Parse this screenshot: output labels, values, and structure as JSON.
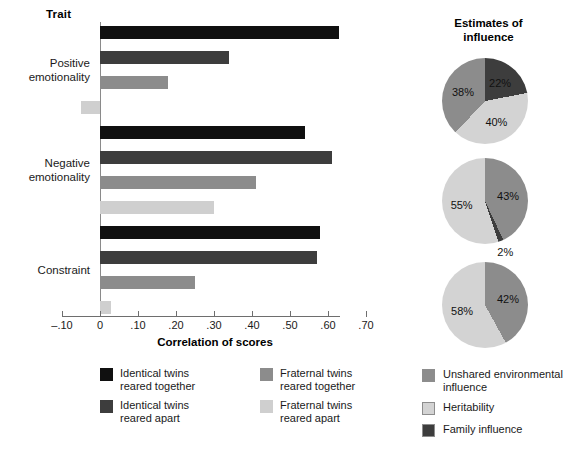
{
  "chart_data": [
    {
      "type": "bar",
      "orientation": "horizontal",
      "title": "",
      "xlabel": "Correlation of scores",
      "ylabel": "Trait",
      "xlim": [
        -0.1,
        0.7
      ],
      "xticks": [
        -0.1,
        0.0,
        0.1,
        0.2,
        0.3,
        0.4,
        0.5,
        0.6,
        0.7
      ],
      "xtick_labels": [
        "–.10",
        "0",
        ".10",
        ".20",
        ".30",
        ".40",
        ".50",
        ".60",
        ".70"
      ],
      "grid": false,
      "categories": [
        "Positive emotionality",
        "Negative emotionality",
        "Constraint"
      ],
      "series": [
        {
          "name": "Identical twins reared together",
          "color": "#101010",
          "values": [
            0.63,
            0.54,
            0.58
          ]
        },
        {
          "name": "Identical twins reared apart",
          "color": "#3d3d3d",
          "values": [
            0.34,
            0.61,
            0.57
          ]
        },
        {
          "name": "Fraternal twins reared together",
          "color": "#8c8c8c",
          "values": [
            0.18,
            0.41,
            0.25
          ]
        },
        {
          "name": "Fraternal twins reared apart",
          "color": "#cfcfcf",
          "values": [
            -0.05,
            0.3,
            0.03
          ]
        }
      ],
      "legend_position": "bottom-left"
    },
    {
      "type": "pie",
      "title": "Estimates of influence",
      "index": 1,
      "labels": [
        "Family influence",
        "Heritability",
        "Unshared environmental influence"
      ],
      "values": [
        22,
        40,
        38
      ],
      "display_labels": [
        "22%",
        "40%",
        "38%"
      ],
      "colors": [
        "#3d3d3d",
        "#d3d3d3",
        "#8c8c8c"
      ]
    },
    {
      "type": "pie",
      "title": "",
      "index": 2,
      "labels": [
        "Unshared environmental influence",
        "Family influence",
        "Heritability"
      ],
      "values": [
        43,
        2,
        55
      ],
      "display_labels": [
        "43%",
        "2%",
        "55%"
      ],
      "colors": [
        "#8c8c8c",
        "#3d3d3d",
        "#d3d3d3"
      ]
    },
    {
      "type": "pie",
      "title": "",
      "index": 3,
      "labels": [
        "Unshared environmental influence",
        "Heritability"
      ],
      "values": [
        42,
        58
      ],
      "display_labels": [
        "42%",
        "58%"
      ],
      "colors": [
        "#8c8c8c",
        "#d3d3d3"
      ]
    }
  ],
  "bar_chart": {
    "trait_header": "Trait",
    "x_axis_title": "Correlation of scores",
    "tick_labels": {
      "t0": "–.10",
      "t1": "0",
      "t2": ".10",
      "t3": ".20",
      "t4": ".30",
      "t5": ".40",
      "t6": ".50",
      "t7": ".60",
      "t8": ".70"
    },
    "traits": [
      {
        "label_line1": "Positive",
        "label_line2": "emotionality"
      },
      {
        "label_line1": "Negative",
        "label_line2": "emotionality"
      },
      {
        "label_line1": "Constraint",
        "label_line2": ""
      }
    ],
    "legend": [
      {
        "label": "Identical twins\nreared together",
        "color": "#101010"
      },
      {
        "label": "Fraternal twins\nreared together",
        "color": "#8c8c8c"
      },
      {
        "label": "Identical twins\nreared apart",
        "color": "#3d3d3d"
      },
      {
        "label": "Fraternal twins\nreared apart",
        "color": "#cfcfcf"
      }
    ]
  },
  "pie_section": {
    "title_line1": "Estimates of",
    "title_line2": "influence",
    "pies": [
      {
        "slices": [
          {
            "pct_label": "22%",
            "color": "#3d3d3d"
          },
          {
            "pct_label": "40%",
            "color": "#d3d3d3"
          },
          {
            "pct_label": "38%",
            "color": "#8c8c8c"
          }
        ]
      },
      {
        "slices": [
          {
            "pct_label": "43%",
            "color": "#8c8c8c"
          },
          {
            "pct_label": "2%",
            "color": "#3d3d3d"
          },
          {
            "pct_label": "55%",
            "color": "#d3d3d3"
          }
        ]
      },
      {
        "slices": [
          {
            "pct_label": "42%",
            "color": "#8c8c8c"
          },
          {
            "pct_label": "58%",
            "color": "#d3d3d3"
          }
        ]
      }
    ],
    "legend": [
      {
        "label": "Unshared environmental influence",
        "color": "#8c8c8c"
      },
      {
        "label": "Heritability",
        "color": "#d3d3d3"
      },
      {
        "label": "Family influence",
        "color": "#3d3d3d"
      }
    ]
  }
}
